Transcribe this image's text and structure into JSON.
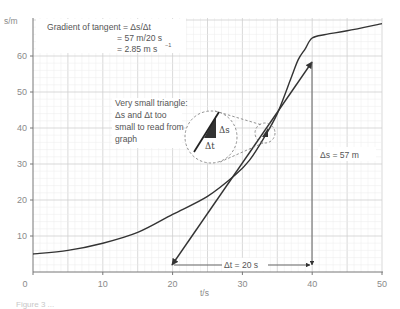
{
  "chart_data": {
    "type": "line",
    "title": "",
    "xlabel": "t/s",
    "ylabel": "s/m",
    "xlim": [
      0,
      50
    ],
    "ylim": [
      0,
      70
    ],
    "grid": true,
    "x_ticks": [
      "0",
      "10",
      "20",
      "30",
      "40",
      "50"
    ],
    "y_ticks": [
      "10",
      "20",
      "30",
      "40",
      "50",
      "60"
    ],
    "series": [
      {
        "name": "displacement-time curve",
        "x": [
          0,
          5,
          10,
          15,
          20,
          25,
          29,
          31,
          33,
          35,
          37,
          38,
          39,
          40,
          42,
          45,
          50
        ],
        "values": [
          5,
          6,
          8,
          11,
          16,
          21,
          27,
          31,
          37,
          44,
          54,
          59,
          62,
          65,
          66,
          67,
          69
        ]
      },
      {
        "name": "tangent at t≈33 s",
        "x": [
          20,
          40
        ],
        "values": [
          2,
          58
        ]
      }
    ],
    "annotations": {
      "gradient_title": "Gradient of tangent = Δs/Δt",
      "gradient_line2": "= 57 m/20 s",
      "gradient_line3": "= 2.85 m s",
      "gradient_exp": "−1",
      "triangle_note": [
        "Very small triangle:",
        "Δs and Δt too",
        "small to read from",
        "graph"
      ],
      "inset_ds": "Δs",
      "inset_dt": "Δt",
      "delta_s": "Δs = 57 m",
      "delta_t": "Δt = 20 s"
    },
    "caption": "Figure 3  ..."
  }
}
